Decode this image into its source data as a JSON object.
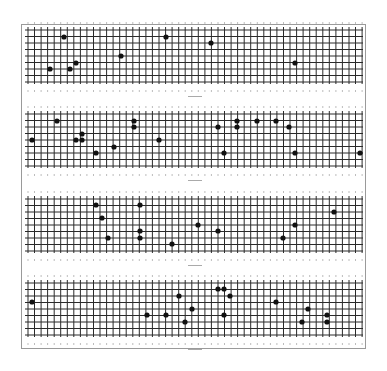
{
  "chart_data": [
    {
      "type": "scatter",
      "title": "",
      "xlabel": "",
      "ylabel": "",
      "grid": true,
      "panel_bounds": {
        "x0": 28,
        "x1": 362,
        "y0": 30,
        "y1": 83
      },
      "points": [
        [
          64,
          37
        ],
        [
          50,
          69
        ],
        [
          70,
          69
        ],
        [
          76,
          63
        ],
        [
          121,
          56
        ],
        [
          166,
          37
        ],
        [
          211,
          43
        ],
        [
          295,
          63
        ]
      ]
    },
    {
      "type": "scatter",
      "title": "",
      "xlabel": "",
      "ylabel": "",
      "grid": true,
      "panel_bounds": {
        "x0": 28,
        "x1": 362,
        "y0": 114,
        "y1": 167
      },
      "points": [
        [
          32,
          140
        ],
        [
          57,
          121
        ],
        [
          76,
          140
        ],
        [
          82,
          134
        ],
        [
          82,
          140
        ],
        [
          96,
          153
        ],
        [
          114,
          147
        ],
        [
          134,
          121
        ],
        [
          134,
          127
        ],
        [
          159,
          140
        ],
        [
          218,
          127
        ],
        [
          224,
          153
        ],
        [
          237,
          121
        ],
        [
          237,
          127
        ],
        [
          257,
          121
        ],
        [
          276,
          121
        ],
        [
          289,
          127
        ],
        [
          295,
          153
        ],
        [
          360,
          153
        ]
      ]
    },
    {
      "type": "scatter",
      "title": "",
      "xlabel": "",
      "ylabel": "",
      "grid": true,
      "panel_bounds": {
        "x0": 28,
        "x1": 362,
        "y0": 199,
        "y1": 251
      },
      "points": [
        [
          96,
          205
        ],
        [
          102,
          218
        ],
        [
          108,
          238
        ],
        [
          140,
          205
        ],
        [
          140,
          231
        ],
        [
          140,
          238
        ],
        [
          172,
          244
        ],
        [
          198,
          225
        ],
        [
          218,
          231
        ],
        [
          283,
          238
        ],
        [
          295,
          225
        ],
        [
          334,
          212
        ]
      ]
    },
    {
      "type": "scatter",
      "title": "",
      "xlabel": "",
      "ylabel": "",
      "grid": true,
      "panel_bounds": {
        "x0": 28,
        "x1": 362,
        "y0": 283,
        "y1": 335
      },
      "points": [
        [
          32,
          302
        ],
        [
          147,
          315
        ],
        [
          166,
          315
        ],
        [
          179,
          296
        ],
        [
          185,
          322
        ],
        [
          192,
          309
        ],
        [
          218,
          289
        ],
        [
          224,
          289
        ],
        [
          230,
          296
        ],
        [
          224,
          315
        ],
        [
          276,
          302
        ],
        [
          302,
          322
        ],
        [
          308,
          309
        ],
        [
          327,
          315
        ],
        [
          327,
          322
        ]
      ]
    }
  ],
  "layout": {
    "grid_spacing_x": 6.55,
    "grid_rows": 9,
    "grid_spacing_y": 6.5
  }
}
